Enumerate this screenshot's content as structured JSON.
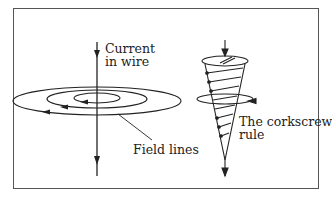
{
  "diagram": {
    "labels": {
      "current_line1": "Current",
      "current_line2": "in wire",
      "field_lines": "Field lines",
      "corkscrew_line1": "The corkscrew",
      "corkscrew_line2": "rule"
    },
    "colors": {
      "line": "#222222",
      "frame": "#555555",
      "background": "#ffffff"
    }
  }
}
